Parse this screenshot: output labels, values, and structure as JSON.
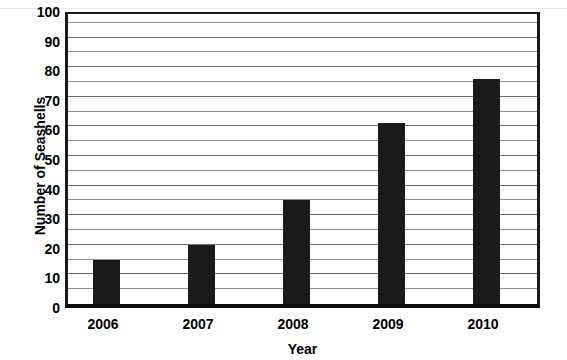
{
  "chart_data": {
    "type": "bar",
    "title": "",
    "xlabel": "Year",
    "ylabel": "Number of Seashells",
    "categories": [
      "2006",
      "2007",
      "2008",
      "2009",
      "2010"
    ],
    "values": [
      15,
      20,
      35,
      61,
      76
    ],
    "ylim": [
      0,
      100
    ],
    "ytick_labels": [
      "0",
      "10",
      "20",
      "30",
      "40",
      "50",
      "60",
      "70",
      "80",
      "90",
      "100"
    ],
    "ytick_values": [
      0,
      10,
      20,
      30,
      40,
      50,
      60,
      70,
      80,
      90,
      100
    ],
    "gridline_values": [
      5,
      10,
      15,
      20,
      25,
      30,
      35,
      40,
      45,
      50,
      55,
      60,
      65,
      70,
      75,
      80,
      85,
      90,
      95,
      100
    ],
    "grid": true,
    "legend": "none",
    "orientation": "vertical",
    "bar_color": "#1a1a1a",
    "background_color": "#ffffff",
    "gridline_color": "#8f8f8f",
    "axis_color": "#1a1a1a"
  }
}
